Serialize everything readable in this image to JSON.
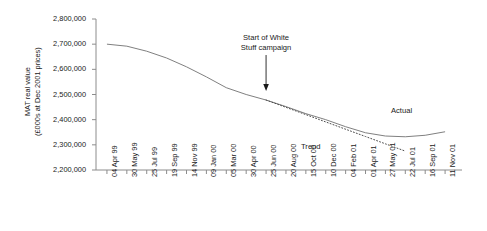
{
  "chart_data": {
    "type": "line",
    "title": "",
    "xlabel": "",
    "ylabel": "MAT real value (£000s at Dec 2001 prices)",
    "ylabel_line1": "MAT real value",
    "ylabel_line2": "(£000s at Dec 2001 prices)",
    "ylim": [
      2200000,
      2800000
    ],
    "ytick_step": 100000,
    "grid": false,
    "legend_position": "inline-labels",
    "ytick_labels": [
      "2,800,000",
      "2,700,000",
      "2,600,000",
      "2,500,000",
      "2,400,000",
      "2,300,000",
      "2,200,000"
    ],
    "ytick_values": [
      2800000,
      2700000,
      2600000,
      2500000,
      2400000,
      2300000,
      2200000
    ],
    "categories": [
      "04 Apr 99",
      "30 May 99",
      "25 Jul 99",
      "19 Sep 99",
      "14 Nov 99",
      "09 Jan 00",
      "05 Mar 00",
      "30 Apr 00",
      "25 Jun 00",
      "20 Aug 00",
      "15 Oct 00",
      "10 Dec 00",
      "04 Feb 01",
      "01 Apr 01",
      "27 May 01",
      "22 Jul 01",
      "16 Sep 01",
      "11 Nov 01"
    ],
    "series": [
      {
        "name": "Actual",
        "style": "solid",
        "color": "#808080",
        "values": [
          2700000,
          2692000,
          2672000,
          2645000,
          2610000,
          2570000,
          2527000,
          2500000,
          2478000,
          2452000,
          2424000,
          2400000,
          2372000,
          2348000,
          2335000,
          2332000,
          2338000,
          2352000
        ]
      },
      {
        "name": "Trend",
        "style": "dotted",
        "color": "#4d4d4d",
        "start_category": "25 Jun 00",
        "values": [
          null,
          null,
          null,
          null,
          null,
          null,
          null,
          null,
          2478000,
          2449000,
          2420000,
          2391000,
          2362000,
          2333000,
          2304000,
          2275000,
          null,
          null
        ]
      }
    ],
    "annotations": [
      {
        "name": "campaign-start",
        "text_line1": "Start of White",
        "text_line2": "Stuff campaign",
        "arrow": "down",
        "target_category": "25 Jun 00"
      }
    ],
    "series_labels": {
      "actual": "Actual",
      "trend": "Trend"
    }
  },
  "colors": {
    "axis": "#8c8c8c",
    "actual_line": "#808080",
    "trend_line": "#4d4d4d",
    "text": "#1a1a1a",
    "background": "#ffffff"
  }
}
